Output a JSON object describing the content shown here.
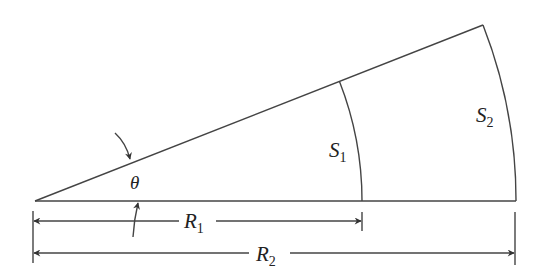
{
  "diagram": {
    "title": "",
    "type": "circular sector with two arcs",
    "colors": {
      "stroke": "#333333",
      "background": "#ffffff"
    },
    "labels": {
      "angle": "θ",
      "s1_main": "S",
      "s1_sub": "1",
      "s2_main": "S",
      "s2_sub": "2",
      "r1_main": "R",
      "r1_sub": "1",
      "r2_main": "R",
      "r2_sub": "2"
    },
    "elements": [
      {
        "id": "apex",
        "point": [
          35,
          201
        ]
      },
      {
        "id": "baseline",
        "from": [
          35,
          201
        ],
        "to": [
          516,
          201
        ]
      },
      {
        "id": "upper-ray",
        "from": [
          35,
          201
        ],
        "to": [
          483,
          25
        ]
      },
      {
        "id": "arc-S1",
        "radius_label": "R1",
        "from": [
          340,
          81
        ],
        "to": [
          362,
          201
        ]
      },
      {
        "id": "arc-S2",
        "radius_label": "R2",
        "from": [
          483,
          25
        ],
        "to": [
          516,
          201
        ]
      },
      {
        "id": "dimension-R1",
        "y": 221,
        "from_x": 35,
        "to_x": 362
      },
      {
        "id": "dimension-R2",
        "y": 253,
        "from_x": 35,
        "to_x": 516
      }
    ]
  }
}
